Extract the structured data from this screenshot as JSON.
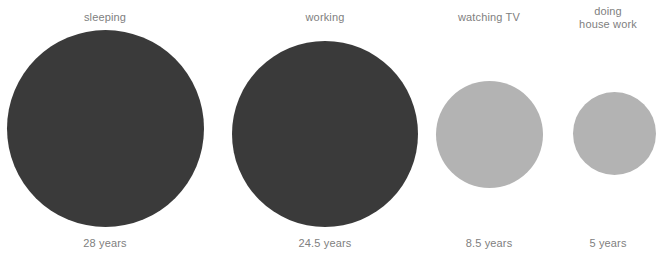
{
  "chart_data": {
    "type": "bubble",
    "title": "",
    "subtitle": "",
    "xlabel": "",
    "ylabel": "",
    "unit": "years",
    "legend": "none",
    "grid": false,
    "encoding": "circle area proportional to value",
    "categories": [
      "sleeping",
      "working",
      "watching TV",
      "doing house work"
    ],
    "values": [
      28,
      24.5,
      8.5,
      5
    ],
    "value_labels": [
      "28 years",
      "24.5 years",
      "8.5 years",
      "5 years"
    ],
    "colors": [
      "#3a3a3a",
      "#3a3a3a",
      "#b3b3b3",
      "#b3b3b3"
    ],
    "series": [
      {
        "name": "lifetime hours spent",
        "values": [
          28,
          24.5,
          8.5,
          5
        ]
      }
    ]
  },
  "palette": {
    "dark": "#3a3a3a",
    "light": "#b3b3b3",
    "text": "#808080",
    "background": "#ffffff"
  },
  "bubbles": [
    {
      "label": "sleeping",
      "value_label": "28 years",
      "value": 28,
      "color": "#3a3a3a"
    },
    {
      "label": "working",
      "value_label": "24.5 years",
      "value": 24.5,
      "color": "#3a3a3a"
    },
    {
      "label": "watching TV",
      "value_label": "8.5 years",
      "value": 8.5,
      "color": "#b3b3b3"
    },
    {
      "label": "doing\nhouse work",
      "value_label": "5 years",
      "value": 5,
      "color": "#b3b3b3"
    }
  ]
}
